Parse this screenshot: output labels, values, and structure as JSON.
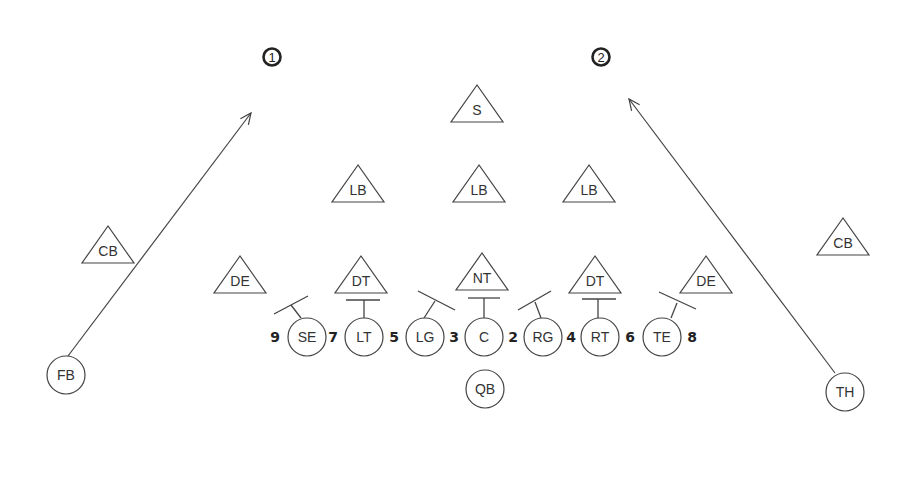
{
  "diagram": {
    "colors": {
      "line": "#444444",
      "text": "#333333",
      "background": "#ffffff"
    },
    "markers": [
      {
        "label": "1",
        "x": 272,
        "y": 57
      },
      {
        "label": "2",
        "x": 601,
        "y": 57
      }
    ],
    "offense": [
      {
        "label": "SE",
        "x": 307,
        "y": 337
      },
      {
        "label": "LT",
        "x": 364,
        "y": 337
      },
      {
        "label": "LG",
        "x": 425,
        "y": 337
      },
      {
        "label": "C",
        "x": 484,
        "y": 337
      },
      {
        "label": "RG",
        "x": 543,
        "y": 337
      },
      {
        "label": "RT",
        "x": 600,
        "y": 337
      },
      {
        "label": "TE",
        "x": 662,
        "y": 337
      },
      {
        "label": "QB",
        "x": 485,
        "y": 389
      },
      {
        "label": "FB",
        "x": 66,
        "y": 375
      },
      {
        "label": "TH",
        "x": 845,
        "y": 392
      }
    ],
    "defense": [
      {
        "label": "S",
        "x": 477,
        "y": 107
      },
      {
        "label": "LB",
        "x": 358,
        "y": 187
      },
      {
        "label": "LB",
        "x": 479,
        "y": 187
      },
      {
        "label": "LB",
        "x": 589,
        "y": 187
      },
      {
        "label": "CB",
        "x": 108,
        "y": 248
      },
      {
        "label": "CB",
        "x": 843,
        "y": 240
      },
      {
        "label": "DE",
        "x": 240,
        "y": 278
      },
      {
        "label": "DT",
        "x": 361,
        "y": 278
      },
      {
        "label": "NT",
        "x": 482,
        "y": 275
      },
      {
        "label": "DT",
        "x": 595,
        "y": 278
      },
      {
        "label": "DE",
        "x": 706,
        "y": 278
      }
    ],
    "gaps": [
      {
        "label": "9",
        "x": 275,
        "y": 342
      },
      {
        "label": "7",
        "x": 333,
        "y": 342
      },
      {
        "label": "5",
        "x": 394,
        "y": 342
      },
      {
        "label": "3",
        "x": 454,
        "y": 342
      },
      {
        "label": "2",
        "x": 513,
        "y": 342
      },
      {
        "label": "4",
        "x": 571,
        "y": 342
      },
      {
        "label": "6",
        "x": 630,
        "y": 342
      },
      {
        "label": "8",
        "x": 692,
        "y": 342
      }
    ],
    "blocks": [
      {
        "from": [
          301,
          318
        ],
        "mid": [
          291,
          305
        ],
        "cap": [
          [
            274,
            314
          ],
          [
            308,
            296
          ]
        ]
      },
      {
        "from": [
          364,
          318
        ],
        "mid": [
          364,
          300
        ],
        "cap": [
          [
            346,
            300
          ],
          [
            380,
            300
          ]
        ]
      },
      {
        "from": [
          424,
          318
        ],
        "mid": [
          435,
          301
        ],
        "cap": [
          [
            418,
            291
          ],
          [
            455,
            310
          ]
        ]
      },
      {
        "from": [
          484,
          318
        ],
        "mid": [
          484,
          298
        ],
        "cap": [
          [
            468,
            298
          ],
          [
            500,
            298
          ]
        ]
      },
      {
        "from": [
          541,
          318
        ],
        "mid": [
          535,
          302
        ],
        "cap": [
          [
            518,
            310
          ],
          [
            551,
            291
          ]
        ]
      },
      {
        "from": [
          598,
          318
        ],
        "mid": [
          598,
          299
        ],
        "cap": [
          [
            582,
            299
          ],
          [
            616,
            299
          ]
        ]
      },
      {
        "from": [
          671,
          318
        ],
        "mid": [
          677,
          303
        ],
        "cap": [
          [
            659,
            292
          ],
          [
            696,
            309
          ]
        ]
      }
    ],
    "routes": [
      {
        "from": [
          68,
          356
        ],
        "to": [
          251,
          113
        ]
      },
      {
        "from": [
          835,
          373
        ],
        "to": [
          629,
          99
        ]
      }
    ]
  }
}
